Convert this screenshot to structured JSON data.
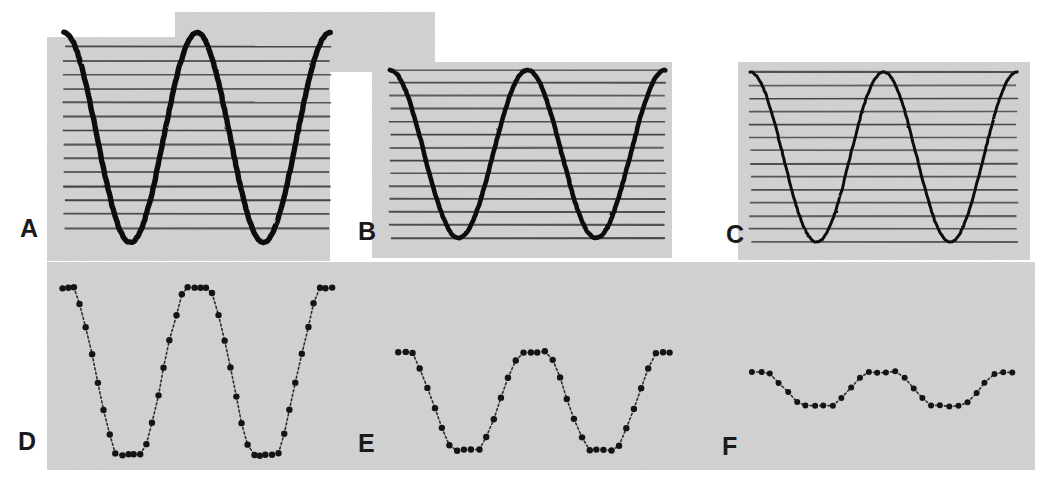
{
  "figure": {
    "background_page_color": "#ffffff",
    "panel_fill_color": "#d2d2d2",
    "hatch_line_color": "#3a3a3a",
    "curve_color": "#111111",
    "dot_color": "#141414",
    "label_color": "#1a1a1a",
    "width": 1040,
    "height": 483
  },
  "panels": [
    {
      "id": "A",
      "label": "A",
      "row": "top",
      "style": "smooth-curve",
      "label_x": 20,
      "label_y": 237,
      "plot": {
        "x": 64,
        "y": 47,
        "width": 266,
        "height": 181
      },
      "backdrop": [
        {
          "x": 47,
          "y": 37,
          "width": 283,
          "height": 224
        },
        {
          "x": 175,
          "y": 12,
          "width": 260,
          "height": 60
        }
      ],
      "hatch_lines": 14,
      "amplitude": 1.0,
      "cycles": 2.0,
      "phase_deg": 90,
      "overshoot_top": 0.18,
      "overshoot_bottom": 0.14
    },
    {
      "id": "B",
      "label": "B",
      "row": "top",
      "style": "smooth-curve",
      "label_x": 358,
      "label_y": 240,
      "plot": {
        "x": 390,
        "y": 70,
        "width": 275,
        "height": 168
      },
      "backdrop": [
        {
          "x": 372,
          "y": 62,
          "width": 300,
          "height": 196
        }
      ],
      "hatch_lines": 14,
      "amplitude": 0.47,
      "cycles": 2.0,
      "phase_deg": 90,
      "overshoot_top": 0.0,
      "overshoot_bottom": 0.0
    },
    {
      "id": "C",
      "label": "C",
      "row": "top",
      "style": "smooth-curve",
      "label_x": 726,
      "label_y": 243,
      "plot": {
        "x": 750,
        "y": 72,
        "width": 267,
        "height": 170
      },
      "backdrop": [
        {
          "x": 738,
          "y": 62,
          "width": 292,
          "height": 198
        }
      ],
      "hatch_lines": 14,
      "amplitude": 0.155,
      "cycles": 2.0,
      "phase_deg": 90,
      "overshoot_top": 0.0,
      "overshoot_bottom": 0.0
    },
    {
      "id": "D",
      "label": "D",
      "row": "bottom",
      "style": "dotted-quantized",
      "label_x": 18,
      "label_y": 450,
      "plot": {
        "x": 62,
        "y": 288,
        "width": 270,
        "height": 167
      },
      "backdrop": [
        {
          "x": 47,
          "y": 262,
          "width": 988,
          "height": 208
        }
      ],
      "amplitude": 1.0,
      "cycles": 2.0,
      "dot_count": 46,
      "clip_top": 0.82,
      "clip_bottom": 0.82
    },
    {
      "id": "E",
      "label": "E",
      "row": "bottom",
      "style": "dotted-quantized",
      "label_x": 358,
      "label_y": 452,
      "plot": {
        "x": 398,
        "y": 352,
        "width": 272,
        "height": 98
      },
      "backdrop": [],
      "amplitude": 0.52,
      "cycles": 2.0,
      "dot_count": 38,
      "clip_top": 0.8,
      "clip_bottom": 0.8
    },
    {
      "id": "F",
      "label": "F",
      "row": "bottom",
      "style": "dotted-quantized",
      "label_x": 722,
      "label_y": 455,
      "plot": {
        "x": 752,
        "y": 372,
        "width": 260,
        "height": 34
      },
      "backdrop": [],
      "amplitude": 0.17,
      "cycles": 2.0,
      "dot_count": 30,
      "clip_top": 0.72,
      "clip_bottom": 0.72
    }
  ],
  "chart_data": {
    "type": "line",
    "xlabel": "",
    "ylabel": "",
    "grid": "horizontal-hatch-lines",
    "legend": "none",
    "annotations": [
      "A",
      "B",
      "C",
      "D",
      "E",
      "F"
    ],
    "x": [
      0,
      0.05,
      0.1,
      0.15,
      0.2,
      0.25,
      0.3,
      0.35,
      0.4,
      0.45,
      0.5,
      0.55,
      0.6,
      0.65,
      0.7,
      0.75,
      0.8,
      0.85,
      0.9,
      0.95,
      1.0
    ],
    "series": [
      {
        "name": "A",
        "description": "Large amplitude sine, 2 cycles, clipped panel window",
        "ylim": [
          -1.18,
          1.18
        ],
        "values": [
          1.0,
          0.59,
          -0.31,
          -0.95,
          -0.95,
          -0.31,
          0.59,
          1.18,
          0.59,
          -0.31,
          -0.95,
          -0.95,
          -0.31,
          0.59,
          1.0,
          0.59,
          -0.31,
          -0.95,
          -0.95,
          -0.31,
          1.0
        ]
      },
      {
        "name": "B",
        "description": "Medium amplitude sine, 2 cycles",
        "ylim": [
          -1.0,
          1.0
        ],
        "values": [
          0.47,
          0.28,
          -0.15,
          -0.45,
          -0.47,
          -0.33,
          0.0,
          0.33,
          0.47,
          0.4,
          0.15,
          -0.2,
          -0.42,
          -0.47,
          -0.35,
          -0.05,
          0.25,
          0.44,
          0.47,
          0.45,
          0.47
        ]
      },
      {
        "name": "C",
        "description": "Small amplitude sine, 2 cycles",
        "ylim": [
          -1.0,
          1.0
        ],
        "values": [
          0.155,
          0.09,
          -0.05,
          -0.145,
          -0.155,
          -0.11,
          0.0,
          0.11,
          0.155,
          0.13,
          0.05,
          -0.07,
          -0.14,
          -0.155,
          -0.115,
          -0.015,
          0.085,
          0.145,
          0.155,
          0.15,
          0.155
        ]
      },
      {
        "name": "D",
        "description": "Digitized/quantized version of A — dotted trapezoid, flat-clipped extrema",
        "ylim": [
          -1.0,
          1.0
        ],
        "values": [
          1.0,
          0.55,
          -0.3,
          -1.0,
          -1.0,
          -0.3,
          0.55,
          1.0,
          1.0,
          0.55,
          -0.3,
          -1.0,
          -1.0,
          -0.3,
          0.55,
          1.0,
          0.55,
          -0.3,
          -1.0,
          -0.3,
          1.0
        ]
      },
      {
        "name": "E",
        "description": "Digitized/quantized version of B — dotted trapezoid, shorter amplitude",
        "ylim": [
          -1.0,
          1.0
        ],
        "values": [
          0.52,
          0.3,
          0.0,
          -0.4,
          -0.52,
          -0.52,
          -0.2,
          0.2,
          0.5,
          0.52,
          0.52,
          0.3,
          -0.1,
          -0.42,
          -0.52,
          -0.52,
          -0.25,
          0.15,
          0.45,
          0.5,
          0.52
        ]
      },
      {
        "name": "F",
        "description": "Digitized/quantized version of C — nearly flat dotted trace",
        "ylim": [
          -1.0,
          1.0
        ],
        "values": [
          0.17,
          0.02,
          -0.14,
          -0.15,
          -0.1,
          0.05,
          0.17,
          0.17,
          0.17,
          0.17,
          0.17,
          0.1,
          -0.05,
          -0.16,
          -0.17,
          -0.14,
          -0.16,
          -0.08,
          0.05,
          0.14,
          0.17
        ]
      }
    ]
  }
}
